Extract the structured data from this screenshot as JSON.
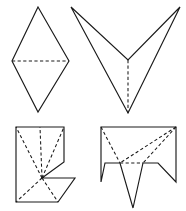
{
  "document": {
    "title": "Polyhedron net figures",
    "description": "Four black-and-white line-drawn geometric net figures arranged in a two-by-two grid on a white background. Solid lines mark outer edges; dashed lines mark interior fold lines.",
    "background_color": "#ffffff",
    "line_color": "#1a1a1a",
    "figure_count": 4,
    "layout": "2x2 grid"
  },
  "legend": {
    "solid_line_meaning": "outer edge",
    "dashed_line_meaning": "fold line",
    "solid_label": "",
    "dashed_label": ""
  },
  "figures": [
    {
      "id": "figure-top-left",
      "name": "rhombus-net",
      "position": "top-left",
      "description": "Tall rhombus (two mirrored triangles) with one horizontal dashed fold line across the widest span.",
      "outline_points": "38,7 69,61 38,112 12,61",
      "fold_lines": [
        {
          "name": "horizontal-fold",
          "points": "12,61 69,61"
        }
      ],
      "vertex_count": 4,
      "fold_count": 1
    },
    {
      "id": "figure-top-right",
      "name": "chevron-net",
      "position": "top-right",
      "description": "Wide arrowhead or chevron with two upper tips, a shallow inner notch, and a lower point, split by a vertical dashed fold line.",
      "outline_points": "71,7 128,60 180,7 128,113",
      "fold_lines": [
        {
          "name": "vertical-fold",
          "points": "128,60 128,113"
        }
      ],
      "vertex_count": 4,
      "fold_count": 1
    },
    {
      "id": "figure-bottom-left",
      "name": "notched-square-net",
      "position": "bottom-left",
      "description": "Square-based net with a stepped notch cut into the right side and a re-entrant wedge at the lower right; five dashed fold lines radiate from a central point.",
      "outline_points": "16,127 64,127 64,162 42,178 75,178 58,202 16,202",
      "fold_lines": [
        {
          "name": "fold-to-top-left",
          "points": "42,178 16,127"
        },
        {
          "name": "fold-to-top-right",
          "points": "42,178 64,127"
        },
        {
          "name": "fold-to-top-edge",
          "points": "42,178 40,127"
        },
        {
          "name": "fold-to-bottom-left",
          "points": "42,178 16,202"
        },
        {
          "name": "fold-to-bottom-edge",
          "points": "42,178 58,202"
        }
      ],
      "vertex_count": 7,
      "fold_count": 5
    },
    {
      "id": "figure-bottom-right",
      "name": "spiked-rectangle-net",
      "position": "bottom-right",
      "description": "Rectangle whose lower border is cut into two outward flaps and a long downward spike; dashed fold lines run from the upper corners to two inner vertices joined by a horizontal dashed segment.",
      "outline_points": "101,127 176,127 176,182 158,163 143,163 133,208 120,163 105,163 101,182",
      "fold_lines": [
        {
          "name": "fold-left-diagonal",
          "points": "101,127 120,163"
        },
        {
          "name": "fold-right-to-left-vertex",
          "points": "176,127 120,163"
        },
        {
          "name": "fold-right-diagonal",
          "points": "176,127 143,163"
        },
        {
          "name": "fold-horizontal-inner",
          "points": "120,163 143,163"
        }
      ],
      "vertex_count": 9,
      "fold_count": 4
    }
  ]
}
